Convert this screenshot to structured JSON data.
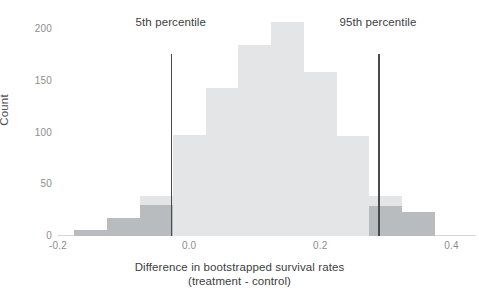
{
  "chart_data": {
    "type": "bar",
    "subtype": "histogram",
    "title": "",
    "xlabel": "Difference in bootstrapped survival rates",
    "xlabel_line2": "(treatment - control)",
    "ylabel": "Count",
    "xlim": [
      -0.2,
      0.41
    ],
    "ylim": [
      0,
      215
    ],
    "xticks": [
      -0.2,
      0.0,
      0.2,
      0.4
    ],
    "xtick_labels": [
      "-0.2",
      "0.0",
      "0.2",
      "0.4"
    ],
    "yticks": [
      0,
      50,
      100,
      150,
      200
    ],
    "ytick_labels": [
      "0",
      "50",
      "100",
      "150",
      "200"
    ],
    "grid": false,
    "legend": "none",
    "bin_width": 0.05,
    "bin_starts": [
      -0.175,
      -0.125,
      -0.075,
      -0.025,
      0.025,
      0.075,
      0.125,
      0.175,
      0.225,
      0.275,
      0.325
    ],
    "categories": [
      "-0.175",
      "-0.125",
      "-0.075",
      "-0.025",
      "0.025",
      "0.075",
      "0.125",
      "0.175",
      "0.225",
      "0.275",
      "0.325"
    ],
    "series": [
      {
        "name": "All bootstrap samples",
        "color": "#e3e5e7",
        "values": [
          6,
          17,
          39,
          98,
          143,
          185,
          207,
          159,
          97,
          39,
          23
        ]
      },
      {
        "name": "Outside 90% interval (tails)",
        "color": "#b9bcbe",
        "values": [
          6,
          17,
          30,
          0,
          0,
          0,
          0,
          0,
          0,
          29,
          23
        ]
      }
    ],
    "annotations": [
      {
        "name": "5th-percentile",
        "label": "5th percentile",
        "x": -0.028,
        "line_top_count": 176,
        "label_count": 205,
        "color": "#4a4a4a"
      },
      {
        "name": "95th-percentile",
        "label": "95th percentile",
        "x": 0.288,
        "line_top_count": 176,
        "label_count": 205,
        "color": "#4a4a4a"
      }
    ]
  },
  "axes": {
    "y_title": "Count",
    "x_title_line1": "Difference in bootstrapped survival rates",
    "x_title_line2": "(treatment - control)"
  },
  "colors": {
    "background": "#ffffff",
    "bar_light": "#e3e5e7",
    "bar_dark": "#b9bcbe",
    "rule": "#4a4a4a",
    "tick_text": "#8d8d8d",
    "axis_text": "#3d3d3d",
    "baseline": "#d8d8d8"
  }
}
